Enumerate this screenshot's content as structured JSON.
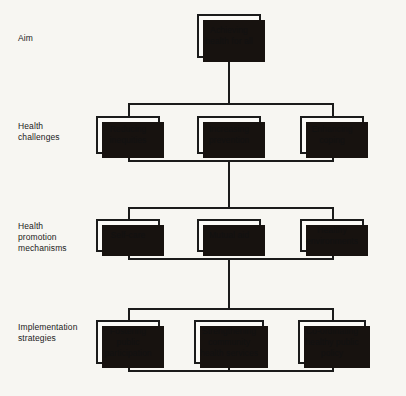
{
  "diagram": {
    "background_color": "#f7f6f2",
    "line_color": "#1b1b1b",
    "box_fill_color": "#fbfaf7",
    "shadow_color": "#17120f",
    "row_labels": [
      {
        "id": "aim",
        "text": "Aim"
      },
      {
        "id": "health-challenges",
        "text": "Health\nchallenges"
      },
      {
        "id": "health-promotion-mechanisms",
        "text": "Health\npromotion\nmechanisms"
      },
      {
        "id": "implementation-strategies",
        "text": "Implementation\nstrategies"
      }
    ],
    "rows": [
      {
        "id": "aim",
        "nodes": [
          {
            "id": "achieving-health-for-all",
            "text": "Achieving\nhealth for all",
            "column": "centre"
          }
        ]
      },
      {
        "id": "health-challenges",
        "nodes": [
          {
            "id": "reducing-inequities",
            "text": "Reducing\ninequities",
            "column": "left"
          },
          {
            "id": "increasing-prevention",
            "text": "Increasing\nprevention",
            "column": "centre"
          },
          {
            "id": "enhancing-coping",
            "text": "Enhancing\ncoping",
            "column": "right"
          }
        ]
      },
      {
        "id": "health-promotion-mechanisms",
        "nodes": [
          {
            "id": "self-care",
            "text": "Self-care",
            "column": "left"
          },
          {
            "id": "mutual-aid",
            "text": "Mutual aid",
            "column": "centre"
          },
          {
            "id": "healthy-environments",
            "text": "Healthy\nenvironments",
            "column": "right"
          }
        ]
      },
      {
        "id": "implementation-strategies",
        "nodes": [
          {
            "id": "fostering-public-participation",
            "text": "Fostering\npublic\nparticipation",
            "column": "left"
          },
          {
            "id": "strengthening-community-health-services",
            "text": "Strengthening\ncommunity\nhealth services",
            "column": "centre"
          },
          {
            "id": "co-ordinating-healthy-public-policy",
            "text": "Co-ordinating\nhealthy public\npolicy",
            "column": "right"
          }
        ]
      }
    ]
  }
}
